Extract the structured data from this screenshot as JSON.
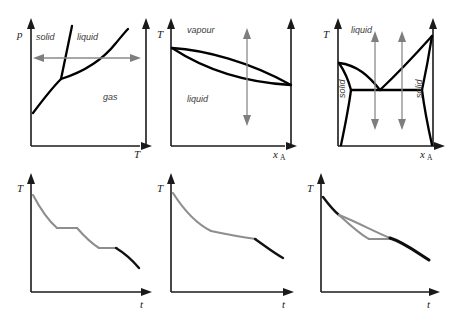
{
  "figure": {
    "colors": {
      "curve": "#000000",
      "axis": "#1a1a1a",
      "label": "#3b3b3b",
      "cooling_gray": "#8e8e8e",
      "cooling_dark": "#111111",
      "arrow_gray": "#8a8a8a",
      "background": "#ffffff"
    }
  },
  "panels": [
    {
      "id": "p-T-phase-diagram",
      "type": "diagram",
      "position": "top-left",
      "axes": {
        "y_label": "p",
        "x_label": "T"
      },
      "regions": [
        {
          "name": "solid",
          "label": "solid"
        },
        {
          "name": "liquid",
          "label": "liquid"
        },
        {
          "name": "gas",
          "label": "gas"
        }
      ],
      "annotation": {
        "name": "isobaric-path",
        "kind": "double-headed-horizontal-arrow"
      },
      "features": [
        "sublimation-curve",
        "fusion-curve",
        "vaporization-curve",
        "triple-point"
      ]
    },
    {
      "id": "vapour-liquid-lens",
      "type": "diagram",
      "position": "top-middle",
      "axes": {
        "y_label": "T",
        "x_label": "x",
        "x_sub": "A"
      },
      "regions": [
        {
          "name": "vapour",
          "label": "vapour"
        },
        {
          "name": "liquid",
          "label": "liquid"
        }
      ],
      "annotations": [
        {
          "name": "cooling-path",
          "kind": "double-headed-vertical-arrow"
        }
      ],
      "features": [
        "liquidus",
        "vapourus",
        "lens-shape"
      ]
    },
    {
      "id": "eutectic-phase-diagram",
      "type": "diagram",
      "position": "top-right",
      "axes": {
        "y_label": "T",
        "x_label": "x",
        "x_sub": "A"
      },
      "regions": [
        {
          "name": "liquid",
          "label": "liquid"
        },
        {
          "name": "solid-left",
          "label": "solid"
        },
        {
          "name": "solid-right",
          "label": "solid"
        }
      ],
      "annotations": [
        {
          "name": "cooling-path-1",
          "kind": "double-headed-vertical-arrow"
        },
        {
          "name": "cooling-path-2",
          "kind": "double-headed-vertical-arrow"
        }
      ],
      "features": [
        "liquidus-left",
        "liquidus-right",
        "eutectic-point",
        "eutectic-horizontal",
        "solidus-left",
        "solidus-right"
      ]
    },
    {
      "id": "cooling-curve-two-breaks",
      "type": "cooling-curve",
      "position": "bottom-left",
      "axes": {
        "y_label": "T",
        "x_label": "t"
      },
      "features": [
        "initial-cooling",
        "first-halt",
        "second-cooling",
        "second-halt",
        "final-cooling"
      ]
    },
    {
      "id": "cooling-curve-one-break",
      "type": "cooling-curve",
      "position": "bottom-middle",
      "axes": {
        "y_label": "T",
        "x_label": "t"
      },
      "features": [
        "initial-cooling",
        "shallow-break",
        "eutectic-halt",
        "final-cooling"
      ]
    },
    {
      "id": "cooling-curve-branched",
      "type": "cooling-curve",
      "position": "bottom-right",
      "axes": {
        "y_label": "T",
        "x_label": "t"
      },
      "features": [
        "branch-upper",
        "branch-lower",
        "short-halt",
        "merged-final-cooling"
      ]
    }
  ]
}
